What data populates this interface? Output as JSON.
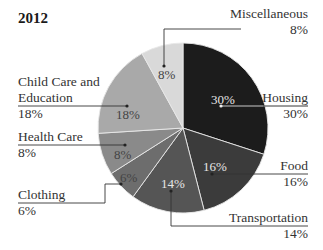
{
  "title": "2012",
  "chart_data": {
    "type": "pie",
    "title": "2012",
    "categories": [
      "Housing",
      "Food",
      "Transportation",
      "Clothing",
      "Health Care",
      "Child Care and Education",
      "Miscellaneous"
    ],
    "values": [
      30,
      16,
      14,
      6,
      8,
      18,
      8
    ],
    "unit": "%",
    "start_angle_deg": 0,
    "direction": "clockwise from 12 o'clock",
    "colors": [
      "#1c1c1c",
      "#3b3b3b",
      "#555555",
      "#6d6d6d",
      "#8a8a8a",
      "#a9a9a9",
      "#d9d9d9"
    ],
    "legend": "callout labels"
  },
  "labels": {
    "housing": {
      "name": "Housing",
      "pct": "30%",
      "inner": "30%"
    },
    "food": {
      "name": "Food",
      "pct": "16%",
      "inner": "16%"
    },
    "transportation": {
      "name": "Transportation",
      "pct": "14%",
      "inner": "14%"
    },
    "clothing": {
      "name": "Clothing",
      "pct": "6%",
      "inner": "6%"
    },
    "health": {
      "name": "Health Care",
      "pct": "8%",
      "inner": "8%"
    },
    "childcare": {
      "name1": "Child Care and",
      "name2": "Education",
      "pct": "18%",
      "inner": "18%"
    },
    "misc": {
      "name": "Miscellaneous",
      "pct": "8%",
      "inner": "8%"
    }
  }
}
